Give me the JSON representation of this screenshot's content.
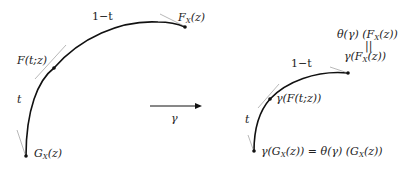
{
  "left_diagram": {
    "label_top": "1−t",
    "label_side": "t",
    "label_end": "F_X(z)",
    "label_mid": "F(t;z)",
    "label_start": "G_X(z)"
  },
  "map": {
    "label": "γ"
  },
  "right_diagram": {
    "label_top": "1−t",
    "label_side": "t",
    "label_end_top": "θ(γ) (F_X(z))",
    "label_end_eq": "॥",
    "label_end_bottom": "γ(F_X(z))",
    "label_mid": "γ(F(t;z))",
    "label_start": "γ(G_X(z)) = θ(γ) (G_X(z))"
  },
  "colors": {
    "curve": "#111111",
    "tangent": "#888888",
    "text": "#222222"
  }
}
